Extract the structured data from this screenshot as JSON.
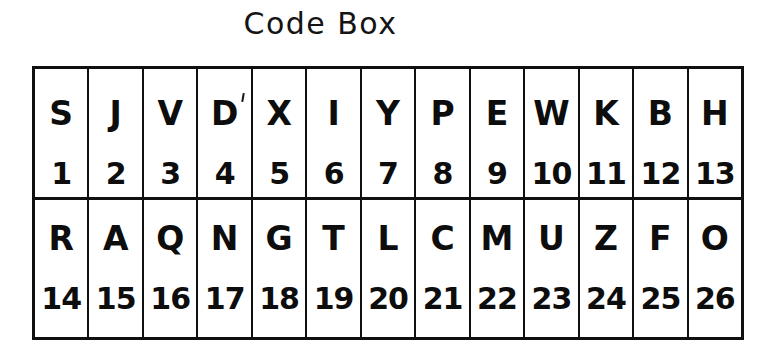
{
  "page": {
    "title": "Code Box",
    "background_color": "#ffffff",
    "ink_color": "#101010"
  },
  "code_box": {
    "rows": [
      {
        "cells": [
          {
            "letter": "S",
            "number": "1"
          },
          {
            "letter": "J",
            "number": "2"
          },
          {
            "letter": "V",
            "number": "3"
          },
          {
            "letter": "D",
            "number": "4"
          },
          {
            "letter": "X",
            "number": "5"
          },
          {
            "letter": "I",
            "number": "6"
          },
          {
            "letter": "Y",
            "number": "7"
          },
          {
            "letter": "P",
            "number": "8"
          },
          {
            "letter": "E",
            "number": "9"
          },
          {
            "letter": "W",
            "number": "10"
          },
          {
            "letter": "K",
            "number": "11"
          },
          {
            "letter": "B",
            "number": "12"
          },
          {
            "letter": "H",
            "number": "13"
          }
        ]
      },
      {
        "cells": [
          {
            "letter": "R",
            "number": "14"
          },
          {
            "letter": "A",
            "number": "15"
          },
          {
            "letter": "Q",
            "number": "16"
          },
          {
            "letter": "N",
            "number": "17"
          },
          {
            "letter": "G",
            "number": "18"
          },
          {
            "letter": "T",
            "number": "19"
          },
          {
            "letter": "L",
            "number": "20"
          },
          {
            "letter": "C",
            "number": "21"
          },
          {
            "letter": "M",
            "number": "22"
          },
          {
            "letter": "U",
            "number": "23"
          },
          {
            "letter": "Z",
            "number": "24"
          },
          {
            "letter": "F",
            "number": "25"
          },
          {
            "letter": "O",
            "number": "26"
          }
        ]
      }
    ]
  }
}
